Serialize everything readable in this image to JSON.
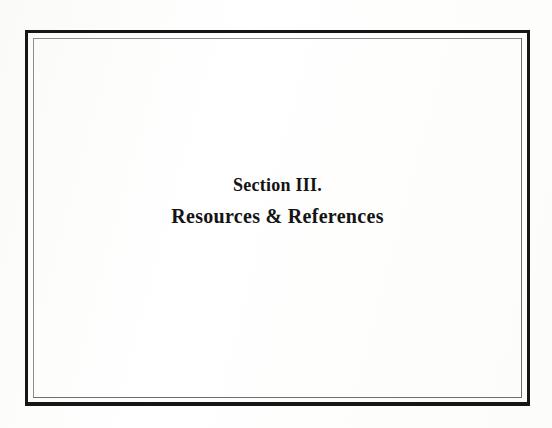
{
  "document": {
    "kind": "section-divider-page",
    "background_color": "#fefefe",
    "text_color": "#141414"
  },
  "frame": {
    "style": "double-rule",
    "outer_rule_color": "#161616",
    "inner_rule_color": "#8e8e8e"
  },
  "title_block": {
    "section_number": "Section III.",
    "section_title": "Resources & References",
    "alignment": "center"
  }
}
